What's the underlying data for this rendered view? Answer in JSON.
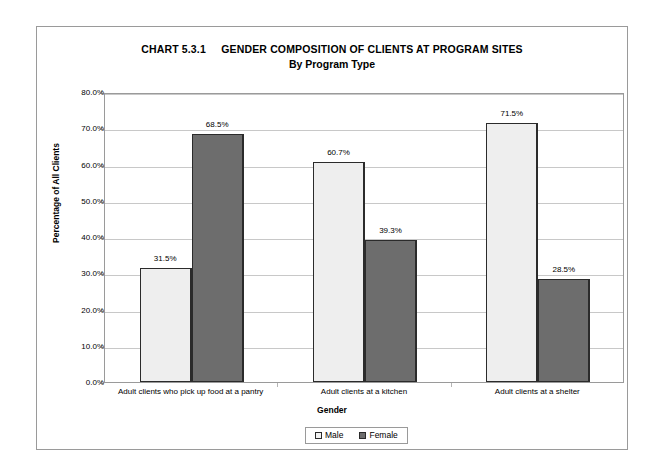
{
  "chart_data": {
    "type": "bar",
    "title": "CHART 5.3.1     GENDER COMPOSITION OF CLIENTS AT PROGRAM SITES",
    "title_label": "CHART 5.3.1",
    "title_text": "GENDER COMPOSITION OF CLIENTS AT PROGRAM SITES",
    "subtitle": "By Program Type",
    "xlabel": "Gender",
    "ylabel": "Percentage of All Clients",
    "categories": [
      "Adult clients who pick up food at a pantry",
      "Adult clients at a kitchen",
      "Adult clients at a shelter"
    ],
    "series": [
      {
        "name": "Male",
        "color": "#eeeeee",
        "values": [
          31.5,
          60.7,
          71.5
        ],
        "labels": [
          "31.5%",
          "60.7%",
          "71.5%"
        ]
      },
      {
        "name": "Female",
        "color": "#6d6d6d",
        "values": [
          68.5,
          39.3,
          28.5
        ],
        "labels": [
          "68.5%",
          "39.3%",
          "28.5%"
        ]
      }
    ],
    "ylim": [
      0,
      80
    ],
    "ytick_values": [
      0,
      10,
      20,
      30,
      40,
      50,
      60,
      70,
      80
    ],
    "ytick_labels": [
      "0.0%",
      "10.0%",
      "20.0%",
      "30.0%",
      "40.0%",
      "50.0%",
      "60.0%",
      "70.0%",
      "80.0%"
    ],
    "grid": true,
    "legend_position": "bottom",
    "legend_entries": [
      "Male",
      "Female"
    ]
  }
}
